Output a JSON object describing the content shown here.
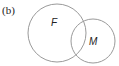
{
  "panel_label": "(b)",
  "diagram": {
    "type": "venn",
    "sets": [
      {
        "name": "F",
        "label": "F",
        "cx": 57,
        "cy": 33,
        "r": 29
      },
      {
        "name": "M",
        "label": "M",
        "cx": 93,
        "cy": 41,
        "r": 22
      }
    ],
    "stroke_color": "#9a9a9a"
  }
}
